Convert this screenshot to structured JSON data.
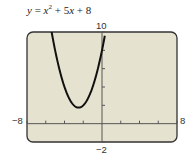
{
  "chart_data": {
    "type": "line",
    "equation": "y = x^2 + 5x + 8",
    "xlabel": "",
    "ylabel": "",
    "xlim": [
      -8,
      8
    ],
    "ylim": [
      -2,
      10
    ],
    "x_tick_step": 2,
    "y_tick_step": 2,
    "grid": false,
    "legend": null,
    "axis_labels": {
      "xmin": "−8",
      "xmax": "8",
      "ymin": "−2",
      "ymax": "10"
    },
    "series": [
      {
        "name": "y = x^2 + 5x + 8",
        "x": [
          -5.4,
          -5,
          -4.5,
          -4,
          -3.5,
          -3,
          -2.5,
          -2,
          -1.5,
          -1,
          -0.5,
          0,
          0.25
        ],
        "values": [
          10.16,
          8,
          5.75,
          4,
          2.75,
          2,
          1.75,
          2,
          2.75,
          4,
          5.75,
          8,
          9.31
        ]
      }
    ],
    "vertex": [
      -2.5,
      1.75
    ],
    "colors": {
      "frame_fill": "#e6e2d0",
      "frame_border": "#333333",
      "curve": "#111111",
      "axis": "#555555"
    }
  },
  "title_parts": {
    "y": "y",
    "eq": " = ",
    "x1": "x",
    "sup": "2",
    "rest1": " + 5",
    "x2": "x",
    "rest2": " + 8"
  }
}
